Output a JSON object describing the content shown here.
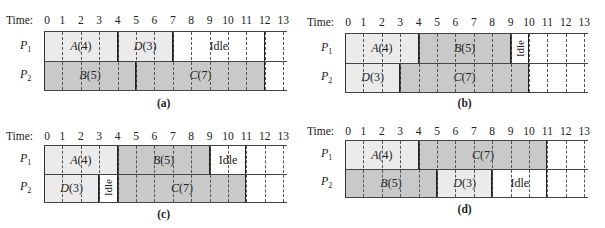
{
  "figure": {
    "time_label": "Time:",
    "ticks": [
      "0",
      "1",
      "2",
      "3",
      "4",
      "5",
      "6",
      "7",
      "8",
      "9",
      "10",
      "11",
      "12",
      "13"
    ],
    "processors": [
      "P1",
      "P2"
    ],
    "colors": {
      "light": "#ebebeb",
      "dark": "#c9c9c9",
      "idle": "#ffffff",
      "line": "#333333"
    }
  },
  "chart_data": [
    {
      "type": "table",
      "title": "(a)",
      "caption": "(a)",
      "xlim": [
        0,
        13
      ],
      "rows": [
        {
          "proc": "P1",
          "blocks": [
            {
              "label": "A(4)",
              "task": "A",
              "dur": 4,
              "start": 0,
              "end": 4,
              "shade": "light"
            },
            {
              "label": "D(3)",
              "task": "D",
              "dur": 3,
              "start": 4,
              "end": 7,
              "shade": "light"
            },
            {
              "label": "Idle",
              "start": 7,
              "end": 12,
              "shade": "idle"
            }
          ]
        },
        {
          "proc": "P2",
          "blocks": [
            {
              "label": "B(5)",
              "task": "B",
              "dur": 5,
              "start": 0,
              "end": 5,
              "shade": "dark"
            },
            {
              "label": "C(7)",
              "task": "C",
              "dur": 7,
              "start": 5,
              "end": 12,
              "shade": "dark"
            }
          ]
        }
      ]
    },
    {
      "type": "table",
      "title": "(b)",
      "caption": "(b)",
      "xlim": [
        0,
        13
      ],
      "rows": [
        {
          "proc": "P1",
          "blocks": [
            {
              "label": "A(4)",
              "task": "A",
              "dur": 4,
              "start": 0,
              "end": 4,
              "shade": "light"
            },
            {
              "label": "B(5)",
              "task": "B",
              "dur": 5,
              "start": 4,
              "end": 9,
              "shade": "dark"
            },
            {
              "label": "Idle",
              "start": 9,
              "end": 10,
              "shade": "idle",
              "vertical": true
            }
          ]
        },
        {
          "proc": "P2",
          "blocks": [
            {
              "label": "D(3)",
              "task": "D",
              "dur": 3,
              "start": 0,
              "end": 3,
              "shade": "light"
            },
            {
              "label": "C(7)",
              "task": "C",
              "dur": 7,
              "start": 3,
              "end": 10,
              "shade": "dark"
            }
          ]
        }
      ]
    },
    {
      "type": "table",
      "title": "(c)",
      "caption": "(c)",
      "xlim": [
        0,
        13
      ],
      "rows": [
        {
          "proc": "P1",
          "blocks": [
            {
              "label": "A(4)",
              "task": "A",
              "dur": 4,
              "start": 0,
              "end": 4,
              "shade": "light"
            },
            {
              "label": "B(5)",
              "task": "B",
              "dur": 5,
              "start": 4,
              "end": 9,
              "shade": "dark"
            },
            {
              "label": "Idle",
              "start": 9,
              "end": 11,
              "shade": "idle"
            }
          ]
        },
        {
          "proc": "P2",
          "blocks": [
            {
              "label": "D(3)",
              "task": "D",
              "dur": 3,
              "start": 0,
              "end": 3,
              "shade": "light"
            },
            {
              "label": "Idle",
              "start": 3,
              "end": 4,
              "shade": "idle",
              "vertical": true
            },
            {
              "label": "C(7)",
              "task": "C",
              "dur": 7,
              "start": 4,
              "end": 11,
              "shade": "dark"
            }
          ]
        }
      ]
    },
    {
      "type": "table",
      "title": "(d)",
      "caption": "(d)",
      "xlim": [
        0,
        13
      ],
      "rows": [
        {
          "proc": "P1",
          "blocks": [
            {
              "label": "A(4)",
              "task": "A",
              "dur": 4,
              "start": 0,
              "end": 4,
              "shade": "light"
            },
            {
              "label": "C(7)",
              "task": "C",
              "dur": 7,
              "start": 4,
              "end": 11,
              "shade": "dark"
            }
          ]
        },
        {
          "proc": "P2",
          "blocks": [
            {
              "label": "B(5)",
              "task": "B",
              "dur": 5,
              "start": 0,
              "end": 5,
              "shade": "dark"
            },
            {
              "label": "D(3)",
              "task": "D",
              "dur": 3,
              "start": 5,
              "end": 8,
              "shade": "light"
            },
            {
              "label": "Idle",
              "start": 8,
              "end": 11,
              "shade": "idle"
            }
          ]
        }
      ]
    }
  ]
}
